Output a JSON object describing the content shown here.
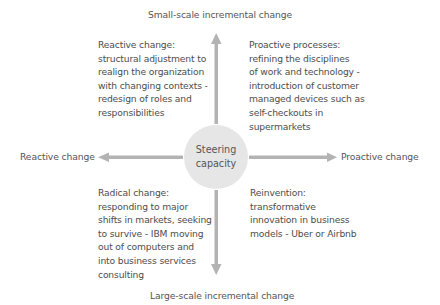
{
  "diagram": {
    "center": {
      "line1": "Steering",
      "line2": "capacity"
    },
    "axes": {
      "top": "Small-scale incremental change",
      "bottom": "Large-scale incremental change",
      "left": "Reactive change",
      "right": "Proactive change"
    },
    "quadrants": {
      "top_left": [
        "Reactive change:",
        "structural adjustment to",
        "realign the organization",
        "with changing contexts -",
        "redesign of roles and",
        "responsibilities"
      ],
      "top_right": [
        "Proactive processes:",
        "refining the disciplines",
        "of work and technology -",
        "introduction of customer",
        "managed devices such as",
        "self-checkouts in",
        "supermarkets"
      ],
      "bottom_left": [
        "Radical change:",
        "responding to major",
        "shifts in markets, seeking",
        "to survive - IBM moving",
        "out of computers and",
        "into business services",
        "consulting"
      ],
      "bottom_right": [
        "Reinvention:",
        "transformative",
        "innovation in business",
        "models - Uber or Airbnb"
      ]
    },
    "colors": {
      "arrow": "#b3b3b3",
      "circle": "#e6e6e6",
      "text": "#4d4d4d"
    }
  }
}
